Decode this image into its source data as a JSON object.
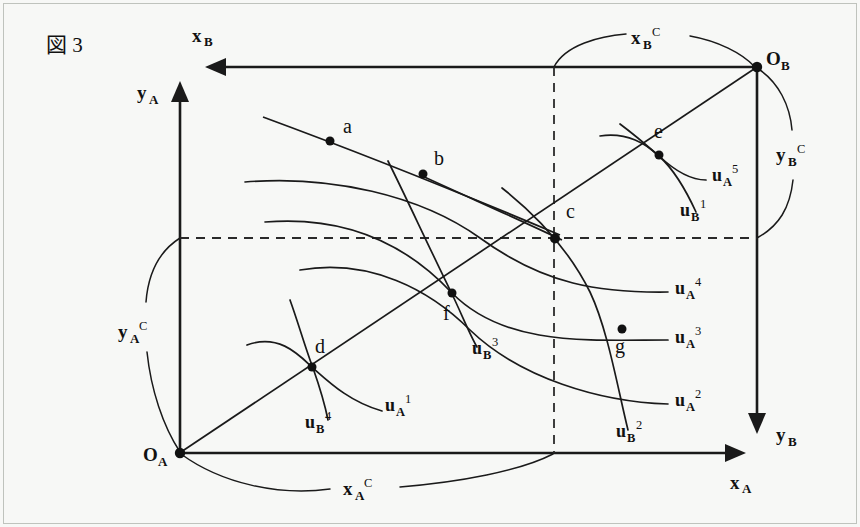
{
  "figure": {
    "title": "図 3",
    "type": "edgeworth-box-diagram"
  },
  "axes": {
    "x_a_label": "x",
    "x_a_sub": "A",
    "y_a_label": "y",
    "y_a_sub": "A",
    "x_b_label": "x",
    "x_b_sub": "B",
    "y_b_label": "y",
    "y_b_sub": "B"
  },
  "origins": {
    "origin_a_label": "O",
    "origin_a_sub": "A",
    "origin_b_label": "O",
    "origin_b_sub": "B"
  },
  "braces": {
    "x_a_c": {
      "base": "x",
      "sub": "A",
      "sup": "C"
    },
    "y_a_c": {
      "base": "y",
      "sub": "A",
      "sup": "C"
    },
    "x_b_c": {
      "base": "x",
      "sub": "B",
      "sup": "C"
    },
    "y_b_c": {
      "base": "y",
      "sub": "B",
      "sup": "C"
    }
  },
  "points": [
    {
      "id": "a",
      "label": "a",
      "x": 330,
      "y": 141,
      "label_x": 343,
      "label_y": 133
    },
    {
      "id": "b",
      "label": "b",
      "x": 423,
      "y": 174,
      "label_x": 434,
      "label_y": 165
    },
    {
      "id": "c",
      "label": "c",
      "x": 555,
      "y": 238,
      "label_x": 566,
      "label_y": 218
    },
    {
      "id": "d",
      "label": "d",
      "x": 312,
      "y": 367,
      "label_x": 316,
      "label_y": 352
    },
    {
      "id": "e",
      "label": "e",
      "x": 659,
      "y": 155,
      "label_x": 659,
      "label_y": 138
    },
    {
      "id": "f",
      "label": "f",
      "x": 452,
      "y": 293,
      "label_x": 444,
      "label_y": 318
    },
    {
      "id": "g",
      "label": "g",
      "x": 622,
      "y": 329,
      "label_x": 617,
      "label_y": 352
    }
  ],
  "curves": [
    {
      "id": "uA1",
      "base": "u",
      "sub": "A",
      "sup": "1",
      "label_x": 385,
      "label_y": 411
    },
    {
      "id": "uA2",
      "base": "u",
      "sub": "A",
      "sup": "2",
      "label_x": 675,
      "label_y": 406
    },
    {
      "id": "uA3",
      "base": "u",
      "sub": "A",
      "sup": "3",
      "label_x": 675,
      "label_y": 343
    },
    {
      "id": "uA4",
      "base": "u",
      "sub": "A",
      "sup": "4",
      "label_x": 675,
      "label_y": 294
    },
    {
      "id": "uA5",
      "base": "u",
      "sub": "A",
      "sup": "5",
      "label_x": 712,
      "label_y": 181
    },
    {
      "id": "uB1",
      "base": "u",
      "sub": "B",
      "sup": "1",
      "label_x": 680,
      "label_y": 216
    },
    {
      "id": "uB2",
      "base": "u",
      "sub": "B",
      "sup": "2",
      "label_x": 616,
      "label_y": 437
    },
    {
      "id": "uB3",
      "base": "u",
      "sub": "B",
      "sup": "3",
      "label_x": 472,
      "label_y": 354
    },
    {
      "id": "uB4",
      "base": "u",
      "sub": "B",
      "sup": "4",
      "label_x": 305,
      "label_y": 428
    }
  ],
  "box": {
    "left": 180,
    "top": 67,
    "right": 757,
    "bottom": 453,
    "dashed_vertical_x": 554,
    "dashed_horizontal_y": 238
  },
  "colors": {
    "ink": "#111111",
    "paper": "#f7f8f6"
  }
}
